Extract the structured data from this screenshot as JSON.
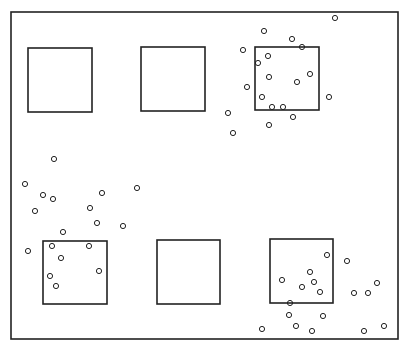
{
  "diagram": {
    "width": 411,
    "height": 346,
    "line_color": "#222222",
    "background": "#ffffff",
    "frame": {
      "x": 11,
      "y": 12,
      "w": 387,
      "h": 327
    },
    "quadrats": [
      {
        "id": "top-left",
        "x": 28,
        "y": 48,
        "w": 64,
        "h": 64
      },
      {
        "id": "top-middle",
        "x": 141,
        "y": 47,
        "w": 64,
        "h": 64
      },
      {
        "id": "top-right",
        "x": 255,
        "y": 47,
        "w": 64,
        "h": 63
      },
      {
        "id": "bottom-left",
        "x": 43,
        "y": 241,
        "w": 64,
        "h": 63
      },
      {
        "id": "bottom-middle",
        "x": 157,
        "y": 240,
        "w": 63,
        "h": 64
      },
      {
        "id": "bottom-right",
        "x": 270,
        "y": 239,
        "w": 63,
        "h": 64
      }
    ],
    "point_radius": 2.6,
    "points": [
      [
        335,
        18
      ],
      [
        264,
        31
      ],
      [
        292,
        39
      ],
      [
        302,
        47
      ],
      [
        243,
        50
      ],
      [
        268,
        56
      ],
      [
        258,
        63
      ],
      [
        310,
        74
      ],
      [
        269,
        77
      ],
      [
        297,
        82
      ],
      [
        247,
        87
      ],
      [
        262,
        97
      ],
      [
        329,
        97
      ],
      [
        272,
        107
      ],
      [
        283,
        107
      ],
      [
        228,
        113
      ],
      [
        293,
        117
      ],
      [
        269,
        125
      ],
      [
        233,
        133
      ],
      [
        54,
        159
      ],
      [
        25,
        184
      ],
      [
        43,
        195
      ],
      [
        53,
        199
      ],
      [
        102,
        193
      ],
      [
        137,
        188
      ],
      [
        35,
        211
      ],
      [
        90,
        208
      ],
      [
        97,
        223
      ],
      [
        123,
        226
      ],
      [
        63,
        232
      ],
      [
        28,
        251
      ],
      [
        52,
        246
      ],
      [
        89,
        246
      ],
      [
        61,
        258
      ],
      [
        99,
        271
      ],
      [
        50,
        276
      ],
      [
        56,
        286
      ],
      [
        327,
        255
      ],
      [
        347,
        261
      ],
      [
        310,
        272
      ],
      [
        282,
        280
      ],
      [
        314,
        282
      ],
      [
        302,
        287
      ],
      [
        320,
        292
      ],
      [
        377,
        283
      ],
      [
        354,
        293
      ],
      [
        368,
        293
      ],
      [
        290,
        303
      ],
      [
        289,
        315
      ],
      [
        323,
        316
      ],
      [
        262,
        329
      ],
      [
        296,
        326
      ],
      [
        312,
        331
      ],
      [
        364,
        331
      ],
      [
        384,
        326
      ]
    ]
  }
}
